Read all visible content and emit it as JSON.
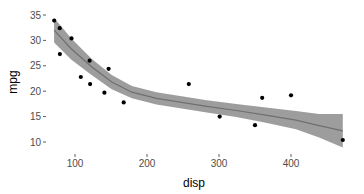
{
  "chart_data": {
    "type": "scatter",
    "title": "",
    "xlabel": "disp",
    "ylabel": "mpg",
    "xlim": [
      55,
      480
    ],
    "ylim": [
      8.5,
      35.2
    ],
    "x_ticks": [
      100,
      200,
      300,
      400
    ],
    "y_ticks": [
      10,
      15,
      20,
      25,
      30,
      35
    ],
    "grid": false,
    "legend": null,
    "points": [
      {
        "x": 71.1,
        "y": 33.9
      },
      {
        "x": 78.7,
        "y": 32.4
      },
      {
        "x": 95.1,
        "y": 30.4
      },
      {
        "x": 79.0,
        "y": 27.3
      },
      {
        "x": 120.3,
        "y": 26.0
      },
      {
        "x": 146.7,
        "y": 24.4
      },
      {
        "x": 108.0,
        "y": 22.8
      },
      {
        "x": 121.0,
        "y": 21.4
      },
      {
        "x": 140.8,
        "y": 19.7
      },
      {
        "x": 167.6,
        "y": 17.8
      },
      {
        "x": 258.0,
        "y": 21.4
      },
      {
        "x": 301.0,
        "y": 15.0
      },
      {
        "x": 360.0,
        "y": 18.7
      },
      {
        "x": 400.0,
        "y": 19.2
      },
      {
        "x": 350.0,
        "y": 13.3
      },
      {
        "x": 472.0,
        "y": 10.4
      }
    ],
    "smooth": {
      "method": "loess",
      "x": [
        71,
        95,
        123,
        151,
        179,
        213,
        248,
        283,
        324,
        365,
        407,
        439,
        472
      ],
      "y": [
        32.0,
        28.3,
        24.8,
        21.8,
        19.8,
        18.6,
        17.8,
        17.0,
        16.2,
        15.3,
        14.3,
        13.2,
        12.2
      ],
      "lower": [
        29.6,
        26.2,
        23.2,
        20.4,
        18.6,
        17.4,
        16.6,
        15.8,
        14.9,
        13.8,
        12.5,
        10.9,
        8.9
      ],
      "upper": [
        34.4,
        30.4,
        26.4,
        23.2,
        21.0,
        19.8,
        19.0,
        18.2,
        17.5,
        16.8,
        16.1,
        15.5,
        15.5
      ]
    },
    "colors": {
      "points": "#000000",
      "line": "#6f6f6f",
      "band": "#8c8c8c",
      "band_opacity": 0.85,
      "tick_label": "#4d4d4d",
      "tick_mark": "#333333",
      "background": "#ffffff"
    }
  }
}
